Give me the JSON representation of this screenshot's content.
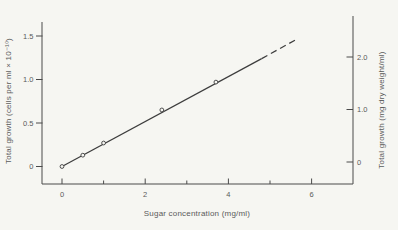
{
  "colors": {
    "background": "#f6f6f2",
    "axis_ink": "#4a4a4a",
    "text_ink": "#5a5a5a",
    "line_ink": "#3d3d3d"
  },
  "chart_data": {
    "type": "line",
    "title": "",
    "xlabel": "Sugar concentration (mg/ml)",
    "ylabel_left": "Total growth (cells per ml × 10⁻¹⁰)",
    "ylabel_right": "Total growth (mg dry weight/ml)",
    "xlim": [
      0,
      7
    ],
    "ylim_left": [
      -0.2,
      1.67
    ],
    "ylim_right": [
      -0.42,
      2.75
    ],
    "grid": false,
    "legend": null,
    "x_ticks": {
      "values": [
        0,
        2,
        4,
        6
      ],
      "labels": [
        "0",
        "2",
        "4",
        "6"
      ],
      "minor": [
        1,
        3,
        5
      ]
    },
    "y_left_ticks": {
      "values": [
        0,
        0.5,
        1.0,
        1.5
      ],
      "labels": [
        "0",
        "0.5",
        "1.0",
        "1.5"
      ]
    },
    "y_right_ticks": {
      "values": [
        0,
        1.0,
        2.0
      ],
      "labels": [
        "0",
        "1.0",
        "2.0"
      ]
    },
    "series": [
      {
        "name": "total growth vs sugar concentration",
        "marker": "open-circle",
        "points_x": [
          0,
          0.5,
          1.0,
          2.4,
          3.7
        ],
        "points_y": [
          0,
          0.13,
          0.27,
          0.65,
          0.97
        ],
        "fit_line_solid": {
          "x1": 0,
          "y1": 0,
          "x2": 4.8,
          "y2": 1.24
        },
        "fit_line_dashed": {
          "x1": 4.8,
          "y1": 1.24,
          "x2": 5.67,
          "y2": 1.47
        }
      }
    ]
  }
}
